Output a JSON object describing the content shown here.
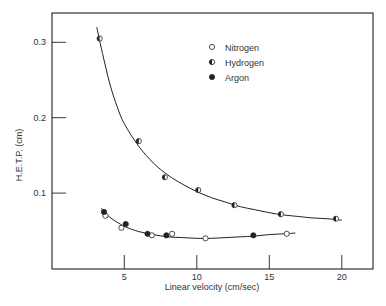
{
  "chart_data": {
    "type": "scatter",
    "title": "",
    "xlabel": "Linear velocity (cm/sec)",
    "ylabel": "H.E.T.P. (cm)",
    "xlim": [
      0,
      22
    ],
    "ylim": [
      0,
      0.34
    ],
    "x_ticks": [
      5,
      10,
      15,
      20
    ],
    "x_tick_labels": [
      "5",
      "10",
      "15",
      "20"
    ],
    "y_ticks": [
      0.1,
      0.2,
      0.3
    ],
    "y_tick_labels": [
      "0.1",
      "0.2",
      "0.3"
    ],
    "grid": false,
    "legend_position": "upper right",
    "series": [
      {
        "name": "Nitrogen",
        "marker": "open-circle",
        "points": [
          [
            3.7,
            0.07
          ],
          [
            4.8,
            0.054
          ],
          [
            6.9,
            0.044
          ],
          [
            8.3,
            0.046
          ],
          [
            10.6,
            0.04
          ],
          [
            16.2,
            0.046
          ]
        ]
      },
      {
        "name": "Hydrogen",
        "marker": "half-filled-circle",
        "points": [
          [
            3.3,
            0.305
          ],
          [
            6.0,
            0.169
          ],
          [
            7.8,
            0.121
          ],
          [
            10.1,
            0.104
          ],
          [
            12.6,
            0.084
          ],
          [
            15.8,
            0.072
          ],
          [
            19.6,
            0.066
          ]
        ]
      },
      {
        "name": "Argon",
        "marker": "filled-circle",
        "points": [
          [
            3.6,
            0.075
          ],
          [
            5.1,
            0.059
          ],
          [
            6.6,
            0.046
          ],
          [
            7.9,
            0.044
          ],
          [
            13.9,
            0.044
          ]
        ]
      }
    ],
    "fitted_curves": [
      {
        "name": "Hydrogen fit",
        "points": [
          [
            3.1,
            0.32
          ],
          [
            3.5,
            0.285
          ],
          [
            4.0,
            0.245
          ],
          [
            4.5,
            0.215
          ],
          [
            5.0,
            0.192
          ],
          [
            6.0,
            0.162
          ],
          [
            7.0,
            0.14
          ],
          [
            8.0,
            0.124
          ],
          [
            9.0,
            0.112
          ],
          [
            10.0,
            0.102
          ],
          [
            11.0,
            0.094
          ],
          [
            12.0,
            0.088
          ],
          [
            13.0,
            0.082
          ],
          [
            14.0,
            0.078
          ],
          [
            15.0,
            0.074
          ],
          [
            16.0,
            0.071
          ],
          [
            17.0,
            0.069
          ],
          [
            18.0,
            0.067
          ],
          [
            19.0,
            0.066
          ],
          [
            20.0,
            0.064
          ]
        ]
      },
      {
        "name": "Nitrogen/Argon fit",
        "points": [
          [
            3.4,
            0.08
          ],
          [
            4.0,
            0.068
          ],
          [
            5.0,
            0.056
          ],
          [
            6.0,
            0.049
          ],
          [
            7.0,
            0.045
          ],
          [
            8.0,
            0.042
          ],
          [
            9.0,
            0.041
          ],
          [
            10.0,
            0.04
          ],
          [
            11.0,
            0.04
          ],
          [
            12.0,
            0.041
          ],
          [
            13.0,
            0.042
          ],
          [
            14.0,
            0.043
          ],
          [
            15.0,
            0.045
          ],
          [
            16.0,
            0.046
          ],
          [
            16.8,
            0.047
          ]
        ]
      }
    ]
  },
  "legend": {
    "items": [
      {
        "label": "Nitrogen",
        "marker": "open-circle"
      },
      {
        "label": "Hydrogen",
        "marker": "half-filled-circle"
      },
      {
        "label": "Argon",
        "marker": "filled-circle"
      }
    ]
  },
  "colors": {
    "ink": "#222222",
    "background": "#ffffff"
  }
}
